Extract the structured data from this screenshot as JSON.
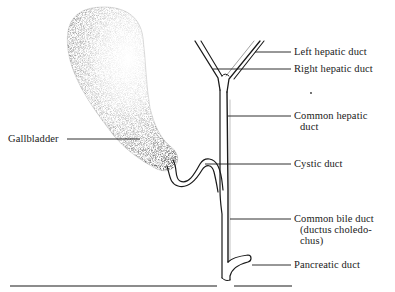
{
  "diagram": {
    "labels": {
      "left_hepatic_duct": "Left hepatic duct",
      "right_hepatic_duct": "Right hepatic duct",
      "common_hepatic_duct_line1": "Common hepatic",
      "common_hepatic_duct_line2": "duct",
      "cystic_duct": "Cystic duct",
      "common_bile_duct_line1": "Common bile duct",
      "common_bile_duct_line2": "(ductus choledo-",
      "common_bile_duct_line3": "chus)",
      "pancreatic_duct": "Pancreatic duct",
      "gallbladder": "Gallbladder"
    },
    "colors": {
      "ink": "#1a1a1a",
      "background": "#ffffff",
      "stipple": "#2a2a2a"
    }
  }
}
